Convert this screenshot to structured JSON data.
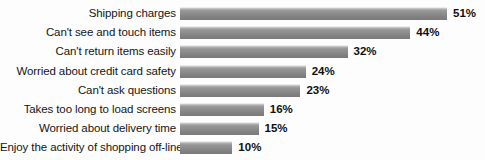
{
  "chart_data": {
    "type": "bar",
    "orientation": "horizontal",
    "title": "",
    "subtitle": "",
    "xlabel": "",
    "ylabel": "",
    "xlim": [
      0,
      55
    ],
    "grid": false,
    "legend": null,
    "value_suffix": "%",
    "categories": [
      "Shipping charges",
      "Can't see and touch items",
      "Can't return items easily",
      "Worried about credit card safety",
      "Can't ask questions",
      "Takes too long to load screens",
      "Worried about delivery time",
      "Enjoy the activity of shopping off-line"
    ],
    "values": [
      51,
      44,
      32,
      24,
      23,
      16,
      15,
      10
    ],
    "value_labels": [
      "51%",
      "44%",
      "32%",
      "24%",
      "23%",
      "16%",
      "15%",
      "10%"
    ],
    "bar_color": "#8b8b8b",
    "background_color": "#fdfdfd",
    "text_color": "#151515"
  }
}
